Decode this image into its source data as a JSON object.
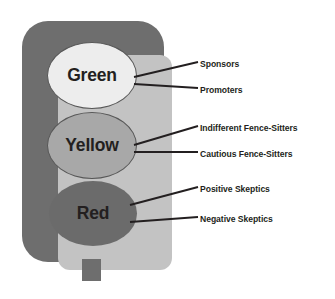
{
  "diagram": {
    "colors": {
      "housing": "#6e6e6e",
      "panel": "#c3c3c3",
      "green_lamp": "#ededed",
      "yellow_lamp": "#a8a8a8",
      "red_lamp": "#6b6b6b",
      "lamp_outline": "#575757",
      "text": "#231f20",
      "leader_line": "#231f20",
      "background": "#ffffff"
    },
    "lamps": [
      {
        "id": "green",
        "label": "Green"
      },
      {
        "id": "yellow",
        "label": "Yellow"
      },
      {
        "id": "red",
        "label": "Red"
      }
    ],
    "callouts": [
      {
        "lamp": "green",
        "label": "Sponsors"
      },
      {
        "lamp": "green",
        "label": "Promoters"
      },
      {
        "lamp": "yellow",
        "label": "Indifferent Fence-Sitters"
      },
      {
        "lamp": "yellow",
        "label": "Cautious Fence-Sitters"
      },
      {
        "lamp": "red",
        "label": "Positive Skeptics"
      },
      {
        "lamp": "red",
        "label": "Negative Skeptics"
      }
    ]
  }
}
